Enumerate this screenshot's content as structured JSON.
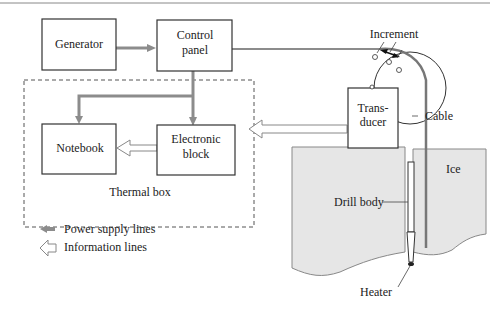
{
  "figure": {
    "blocks": {
      "generator": "Generator",
      "control_panel_line1": "Control",
      "control_panel_line2": "panel",
      "notebook": "Notebook",
      "electronic_block_line1": "Electronic",
      "electronic_block_line2": "block",
      "transducer_line1": "Trans-",
      "transducer_line2": "ducer"
    },
    "group_label": "Thermal box",
    "callouts": {
      "increment": "Increment",
      "cable": "Cable",
      "ice": "Ice",
      "drill_body": "Drill body",
      "heater": "Heater"
    },
    "legend": {
      "power": "Power supply lines",
      "info": "Information lines"
    },
    "colors": {
      "power_line": "#8c8c8c",
      "ice_fill": "#e6e6e6",
      "box_stroke": "#333333"
    }
  }
}
